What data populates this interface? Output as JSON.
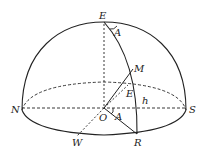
{
  "diagram": {
    "type": "celestial-hemisphere",
    "labels": {
      "zenith": "E",
      "angle_top": "A",
      "point_m": "M",
      "point_e_inner": "E",
      "altitude": "h",
      "north": "N",
      "south": "S",
      "origin": "O",
      "angle_bottom": "A",
      "west": "W",
      "point_r": "R"
    },
    "colors": {
      "stroke": "#222222",
      "background": "#ffffff"
    }
  }
}
